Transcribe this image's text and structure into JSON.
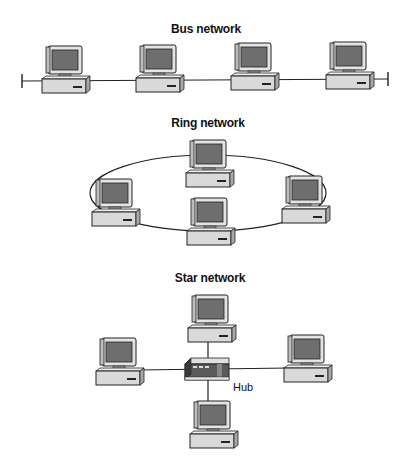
{
  "diagrams": [
    {
      "title": "Bus network",
      "type": "bus",
      "node_count": 4
    },
    {
      "title": "Ring network",
      "type": "ring",
      "node_count": 4
    },
    {
      "title": "Star network",
      "type": "star",
      "node_count": 4,
      "hub_label": "Hub"
    }
  ],
  "icons": {
    "node": "desktop-computer-icon",
    "hub": "network-hub-icon"
  },
  "colors": {
    "screen": "#6e6e6e",
    "case": "#d9d9d9",
    "outline": "#222222",
    "hub_body": "#555555"
  }
}
